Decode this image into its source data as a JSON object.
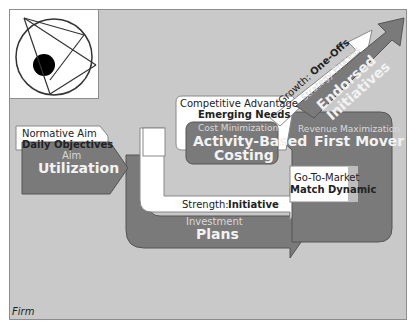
{
  "frame": {
    "label": "Firm"
  },
  "colors": {
    "canvas": "#c9c9c9",
    "shape_dark": "#7a7a7a",
    "shape_white": "#ffffff",
    "text_dark": "#222222",
    "text_light": "#f2f2f2"
  },
  "logo": {
    "icon": "circle-with-arrows-icon"
  },
  "blocks": {
    "normative_aim": {
      "caption": "Normative Aim",
      "title": "Daily Objectives"
    },
    "aim": {
      "caption": "Aim",
      "title": "Utilization"
    },
    "competitive_advantage": {
      "caption": "Competitive Advantage",
      "title": "Emerging Needs"
    },
    "cost_minimization": {
      "caption": "Cost Minimization",
      "title_line1": "Activity-Based",
      "title_line2": "Costing"
    },
    "growth": {
      "caption": "Growth:",
      "title": "One-Offs"
    },
    "strategy_process": {
      "caption": "Strategy Process",
      "title_line1": "Endorsed",
      "title_line2": "Initiatives"
    },
    "revenue_maximization": {
      "caption": "Revenue Maximization",
      "title": "First Mover"
    },
    "go_to_market": {
      "caption": "Go-To-Market",
      "title": "Match Dynamic"
    },
    "strength": {
      "caption": "Strength:",
      "title": "Initiative"
    },
    "investment": {
      "caption": "Investment",
      "title": "Plans"
    }
  }
}
